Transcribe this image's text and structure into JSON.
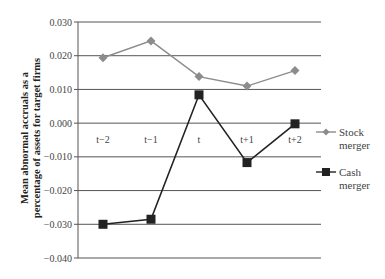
{
  "chart_data": {
    "type": "line",
    "title": "",
    "xlabel": "",
    "ylabel": "Mean abnormal accruals as a percentage of assets for target firms",
    "ylabel_lines": [
      "Mean abnormal accruals as a",
      "percentage of assets for target firms"
    ],
    "categories": [
      "t−2",
      "t−1",
      "t",
      "t+1",
      "t+2"
    ],
    "y_ticks": [
      "0.030",
      "0.020",
      "0.010",
      "0.000",
      "−0.010",
      "−0.020",
      "−0.030",
      "−0.040"
    ],
    "y_tick_values": [
      0.03,
      0.02,
      0.01,
      0.0,
      -0.01,
      -0.02,
      -0.03,
      -0.04
    ],
    "ylim": [
      -0.04,
      0.03
    ],
    "grid": true,
    "category_labels_position": "just below y=0 line",
    "legend_position": "right",
    "series": [
      {
        "name": "Stock merger",
        "label_lines": [
          "Stock",
          "merger"
        ],
        "marker": "diamond",
        "color": "#8c8c8c",
        "values": [
          0.0194,
          0.0244,
          0.0138,
          0.011,
          0.0156
        ]
      },
      {
        "name": "Cash merger",
        "label_lines": [
          "Cash",
          "merger"
        ],
        "marker": "square",
        "color": "#222222",
        "values": [
          -0.03,
          -0.0285,
          0.0084,
          -0.0117,
          -0.0002
        ]
      }
    ]
  }
}
